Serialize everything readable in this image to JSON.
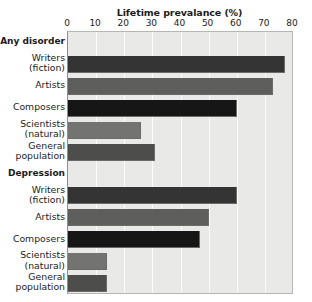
{
  "chart_data": {
    "type": "bar",
    "orientation": "horizontal",
    "title": "Lifetime prevalance (%)",
    "xlabel": "Lifetime prevalance (%)",
    "ylabel": "",
    "xlim": [
      0,
      80
    ],
    "xticks": [
      0,
      10,
      20,
      30,
      40,
      50,
      60,
      70,
      80
    ],
    "xtick_labels": [
      "0",
      "10",
      "20",
      "30",
      "40",
      "50",
      "60",
      "70",
      "80"
    ],
    "grid": true,
    "legend": "none",
    "groups": [
      {
        "name": "Any disorder",
        "categories": [
          "Writers (fiction)",
          "Artists",
          "Composers",
          "Scientists (natural)",
          "General population"
        ],
        "values": [
          77,
          73,
          60,
          26,
          31
        ]
      },
      {
        "name": "Depression",
        "categories": [
          "Writers (fiction)",
          "Artists",
          "Composers",
          "Scientists (natural)",
          "General population"
        ],
        "values": [
          60,
          50,
          47,
          14,
          14
        ]
      }
    ],
    "bar_colors": {
      "Writers (fiction)": "#343434",
      "Artists": "#5e5e5c",
      "Composers": "#161616",
      "Scientists (natural)": "#737371",
      "General population": "#4d4d4b"
    },
    "plot_background": "#e9e9e7",
    "gridline_color": "#fbfbfa",
    "text_color": "#1b1b1b"
  },
  "rows": [
    {
      "kind": "group",
      "label_1": "Any disorder",
      "label_2": "",
      "value": null,
      "color": ""
    },
    {
      "kind": "bar",
      "label_1": "Writers",
      "label_2": "(fiction)",
      "value": 77,
      "color": "#343434"
    },
    {
      "kind": "bar",
      "label_1": "Artists",
      "label_2": "",
      "value": 73,
      "color": "#5e5e5c"
    },
    {
      "kind": "bar",
      "label_1": "Composers",
      "label_2": "",
      "value": 60,
      "color": "#161616"
    },
    {
      "kind": "bar",
      "label_1": "Scientists",
      "label_2": "(natural)",
      "value": 26,
      "color": "#737371"
    },
    {
      "kind": "bar",
      "label_1": "General",
      "label_2": "population",
      "value": 31,
      "color": "#4d4d4b"
    },
    {
      "kind": "group",
      "label_1": "Depression",
      "label_2": "",
      "value": null,
      "color": ""
    },
    {
      "kind": "bar",
      "label_1": "Writers",
      "label_2": "(fiction)",
      "value": 60,
      "color": "#343434"
    },
    {
      "kind": "bar",
      "label_1": "Artists",
      "label_2": "",
      "value": 50,
      "color": "#5e5e5c"
    },
    {
      "kind": "bar",
      "label_1": "Composers",
      "label_2": "",
      "value": 47,
      "color": "#161616"
    },
    {
      "kind": "bar",
      "label_1": "Scientists",
      "label_2": "(natural)",
      "value": 14,
      "color": "#737371"
    },
    {
      "kind": "bar",
      "label_1": "General",
      "label_2": "population",
      "value": 14,
      "color": "#4d4d4b"
    }
  ]
}
